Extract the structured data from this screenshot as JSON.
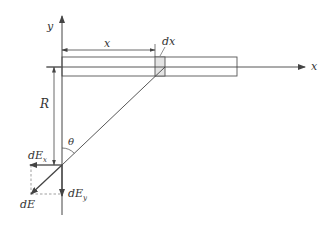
{
  "diagram": {
    "title": "",
    "colors": {
      "line": "#444444",
      "strip_fill": "#e4e4e4",
      "text": "#333333",
      "dashed": "#777777"
    },
    "labels": {
      "y_axis": "y",
      "x_axis": "x",
      "x_distance": "x",
      "dx": "dx",
      "R": "R",
      "theta": "θ",
      "dEx_main": "dE",
      "dEx_sub": "x",
      "dEy_main": "dE",
      "dEy_sub": "y",
      "dE": "dE"
    },
    "elements": [
      {
        "id": "y-axis",
        "type": "arrow",
        "from": [
          62,
          215
        ],
        "to": [
          62,
          16
        ]
      },
      {
        "id": "x-axis",
        "type": "arrow",
        "from": [
          40,
          67
        ],
        "to": [
          305,
          67
        ]
      },
      {
        "id": "rod",
        "type": "rect",
        "x": 62,
        "y": 57,
        "width": 175,
        "height": 19
      },
      {
        "id": "dx-strip",
        "type": "rect",
        "x": 155,
        "y": 57,
        "width": 10,
        "height": 19,
        "shaded": true
      },
      {
        "id": "x-dimension",
        "type": "double-arrow",
        "from": [
          62,
          50
        ],
        "to": [
          155,
          50
        ]
      },
      {
        "id": "R-dimension",
        "type": "double-arrow",
        "from": [
          54,
          67
        ],
        "to": [
          54,
          165
        ]
      },
      {
        "id": "r-line",
        "type": "line",
        "from": [
          62,
          165
        ],
        "to": [
          165,
          67
        ]
      },
      {
        "id": "dEx-vector",
        "type": "arrow",
        "from": [
          62,
          165
        ],
        "to": [
          30,
          165
        ]
      },
      {
        "id": "dEy-vector",
        "type": "arrow",
        "from": [
          62,
          165
        ],
        "to": [
          62,
          195
        ]
      },
      {
        "id": "dE-vector",
        "type": "arrow",
        "from": [
          62,
          165
        ],
        "to": [
          31,
          194
        ]
      },
      {
        "id": "theta-arc",
        "type": "arc",
        "center": [
          62,
          165
        ],
        "note": "angle between y-axis and r-line"
      }
    ]
  }
}
